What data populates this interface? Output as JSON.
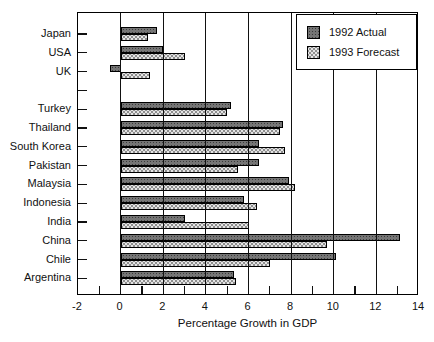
{
  "chart_data": {
    "type": "bar",
    "orientation": "horizontal",
    "title": "",
    "xlabel": "Percentage Growth in GDP",
    "ylabel": "",
    "xlim": [
      -2,
      14
    ],
    "xtick_labels": [
      "-2",
      "0",
      "2",
      "4",
      "6",
      "8",
      "10",
      "12",
      "14"
    ],
    "xtick_values": [
      -2,
      0,
      2,
      4,
      6,
      8,
      10,
      12,
      14
    ],
    "gridlines_at": [
      0,
      2,
      4,
      6,
      8,
      10,
      12
    ],
    "minor_ticks_at": [
      -1,
      1,
      3,
      5,
      7,
      9,
      11,
      13
    ],
    "grid": true,
    "categories": [
      "Japan",
      "USA",
      "UK",
      "Turkey",
      "Thailand",
      "South Korea",
      "Pakistan",
      "Malaysia",
      "Indonesia",
      "India",
      "China",
      "Chile",
      "Argentina"
    ],
    "group_gap_after": "UK",
    "series": [
      {
        "name": "1992 Actual",
        "values": [
          1.7,
          2.0,
          -0.5,
          5.2,
          7.6,
          6.5,
          6.5,
          7.9,
          5.8,
          3.0,
          13.1,
          10.1,
          5.3
        ]
      },
      {
        "name": "1993 Forecast",
        "values": [
          1.3,
          3.0,
          1.4,
          5.0,
          7.5,
          7.7,
          5.5,
          8.2,
          6.4,
          6.0,
          9.7,
          7.0,
          5.4
        ]
      }
    ],
    "legend": {
      "position": "top-right",
      "entries": [
        "1992 Actual",
        "1993 Forecast"
      ]
    },
    "colors": {
      "actual_fill": "#757575",
      "forecast_fill": "#e4e4e4",
      "axis": "#000000",
      "background": "#ffffff"
    }
  }
}
